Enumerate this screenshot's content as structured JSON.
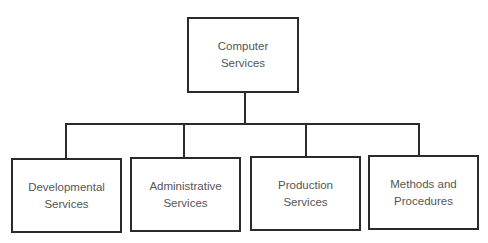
{
  "diagram": {
    "type": "org-chart",
    "root": {
      "line1": "Computer",
      "line2": "Services"
    },
    "children": [
      {
        "line1": "Developmental",
        "line2": "Services"
      },
      {
        "line1": "Administrative",
        "line2": "Services"
      },
      {
        "line1": "Production",
        "line2": "Services"
      },
      {
        "line1": "Methods and",
        "line2": "Procedures"
      }
    ],
    "line_color": "#2a2a2a"
  }
}
